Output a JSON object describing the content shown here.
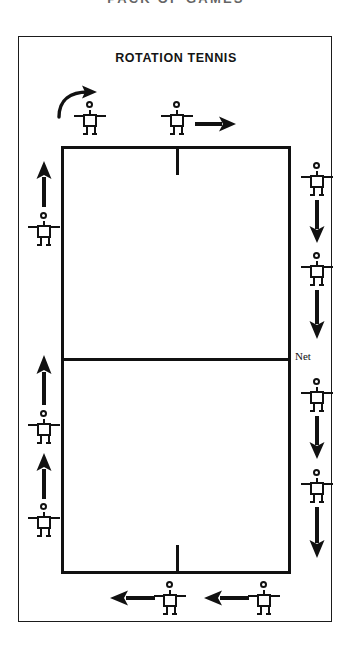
{
  "page": {
    "running_head": "PACK OF GAMES",
    "background_color": "#ffffff",
    "ink_color": "#111111"
  },
  "diagram": {
    "title": "ROTATION TENNIS",
    "net_label": "Net",
    "court": {
      "has_center_service_mark_top": true,
      "has_center_service_mark_bottom": true,
      "net_position": "middle"
    },
    "icons": {
      "player": "stick-figure-icon",
      "arrow_up": "arrow-up-icon",
      "arrow_down": "arrow-down-icon",
      "arrow_left": "arrow-left-icon",
      "arrow_right": "arrow-right-icon",
      "curved": "curved-arrow-icon"
    },
    "players": [
      {
        "id": "top-left-player",
        "side": "top",
        "order": 1
      },
      {
        "id": "top-middle-player",
        "side": "top",
        "order": 2
      },
      {
        "id": "right-upper-player",
        "side": "right",
        "order": 3
      },
      {
        "id": "right-mid-player",
        "side": "right",
        "order": 4
      },
      {
        "id": "right-lower-player",
        "side": "right",
        "order": 5
      },
      {
        "id": "right-bottom-player",
        "side": "right",
        "order": 6
      },
      {
        "id": "bottom-right-player",
        "side": "bottom",
        "order": 7
      },
      {
        "id": "bottom-left-player",
        "side": "bottom",
        "order": 8
      },
      {
        "id": "left-lower-player",
        "side": "left",
        "order": 9
      },
      {
        "id": "left-mid-player",
        "side": "left",
        "order": 10
      },
      {
        "id": "left-upper-player",
        "side": "left",
        "order": 11
      }
    ],
    "flow_arrows": [
      {
        "id": "top-curved-arrow",
        "direction": "curved-right"
      },
      {
        "id": "top-right-arrow",
        "direction": "right"
      },
      {
        "id": "right-arrow-upper",
        "direction": "down"
      },
      {
        "id": "right-arrow-lower",
        "direction": "down"
      },
      {
        "id": "right-arrow-bottom-1",
        "direction": "down"
      },
      {
        "id": "right-arrow-bottom-2",
        "direction": "down"
      },
      {
        "id": "bottom-arrow-left-1",
        "direction": "left"
      },
      {
        "id": "bottom-arrow-left-2",
        "direction": "left"
      },
      {
        "id": "left-arrow-lower",
        "direction": "up"
      },
      {
        "id": "left-arrow-mid",
        "direction": "up"
      },
      {
        "id": "left-arrow-upper",
        "direction": "up"
      }
    ]
  }
}
